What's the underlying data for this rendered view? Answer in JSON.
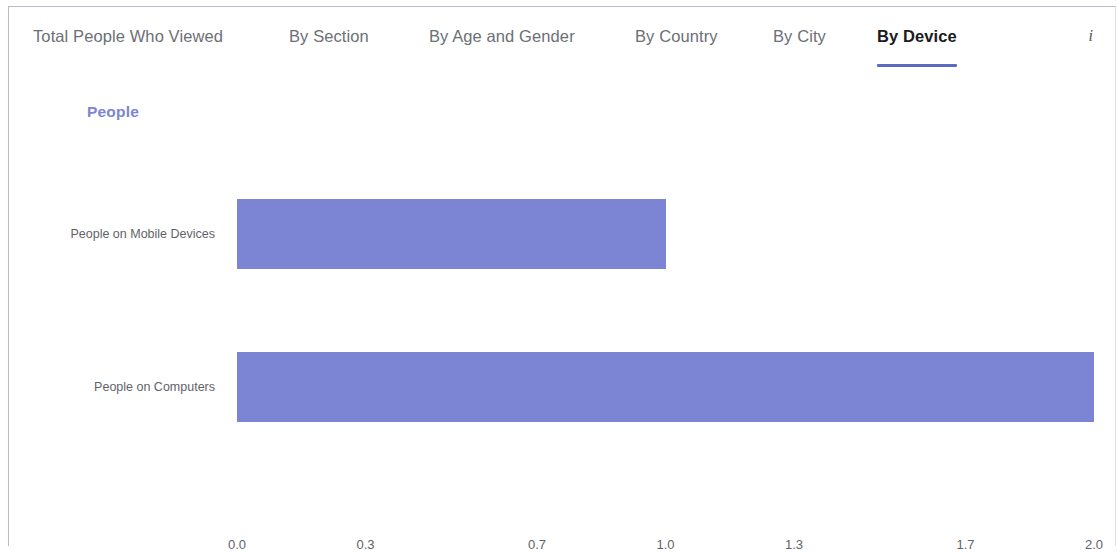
{
  "tabs": [
    {
      "label": "Total People Who Viewed",
      "active": false
    },
    {
      "label": "By Section",
      "active": false
    },
    {
      "label": "By Age and Gender",
      "active": false
    },
    {
      "label": "By Country",
      "active": false
    },
    {
      "label": "By City",
      "active": false
    },
    {
      "label": "By Device",
      "active": true
    }
  ],
  "info_icon": "i",
  "colors": {
    "bar": "#7b85d4",
    "accent": "#5c6bc0",
    "legend_text": "#7b85d4",
    "tab_text": "#6b6f76",
    "tab_active_text": "#1b1b1d"
  },
  "chart_data": {
    "type": "bar",
    "orientation": "horizontal",
    "title": "",
    "xlabel": "",
    "ylabel": "",
    "legend": [
      "People"
    ],
    "legend_position": "top-left",
    "grid": false,
    "categories": [
      "People on Mobile Devices",
      "People on Computers"
    ],
    "values": [
      1.0,
      2.0
    ],
    "series": [
      {
        "name": "People",
        "values": [
          1.0,
          2.0
        ]
      }
    ],
    "xlim": [
      0.0,
      2.0
    ],
    "xticks": [
      "0.0",
      "0.3",
      "0.7",
      "1.0",
      "1.3",
      "1.7",
      "2.0"
    ],
    "xtick_values": [
      0.0,
      0.3,
      0.7,
      1.0,
      1.3,
      1.7,
      2.0
    ]
  }
}
